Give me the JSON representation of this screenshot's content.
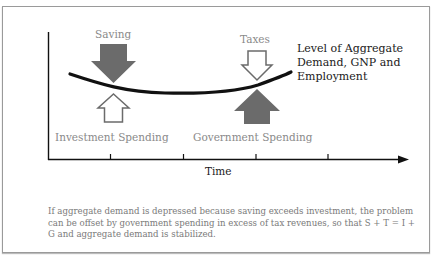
{
  "figure": {
    "labels": {
      "saving": "Saving",
      "taxes": "Taxes",
      "investment": "Investment Spending",
      "government": "Government Spending",
      "curve": "Level of Aggregate Demand, GNP and Employment",
      "x_axis": "Time"
    },
    "caption": "If aggregate demand is depressed because saving exceeds investment, the problem can be offset by government spending in excess of tax revenues, so that S + T = I + G and aggregate demand is stabilized.",
    "colors": {
      "filled_arrow": "#6b6b6b",
      "hollow_arrow_stroke": "#6b6b6b",
      "curve": "#111111",
      "axis": "#111111",
      "label_gray": "#8a8a8a"
    },
    "arrows": [
      {
        "name": "saving",
        "direction": "down",
        "style": "filled"
      },
      {
        "name": "investment",
        "direction": "up",
        "style": "hollow"
      },
      {
        "name": "taxes",
        "direction": "down",
        "style": "hollow"
      },
      {
        "name": "government",
        "direction": "up",
        "style": "filled"
      }
    ],
    "x_ticks": 4
  }
}
